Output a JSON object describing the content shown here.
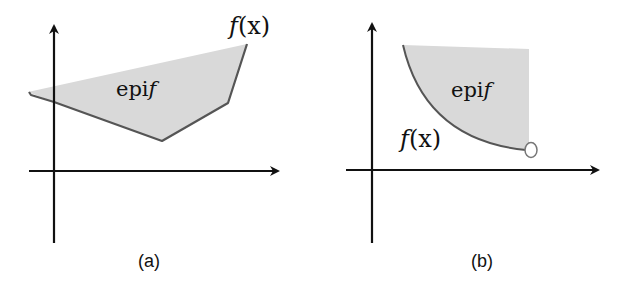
{
  "figures": [
    {
      "id": "a",
      "caption": "(a)",
      "region_label": "epi",
      "region_label_fn": "f",
      "curve_label_fn": "f",
      "curve_label_arg": "(x)",
      "description": "Convex piecewise-linear function; its epigraph shaded gray"
    },
    {
      "id": "b",
      "caption": "(b)",
      "region_label": "epi",
      "region_label_fn": "f",
      "curve_label_fn": "f",
      "curve_label_arg": "(x)",
      "description": "Convex curved function with open endpoint; epigraph shaded gray"
    }
  ],
  "colors": {
    "fill": "#d9d9d9",
    "curve": "#555555",
    "axis": "#111111"
  }
}
